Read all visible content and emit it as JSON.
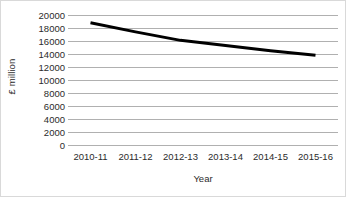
{
  "chart_data": {
    "type": "line",
    "title": "",
    "subtitle": "",
    "xlabel": "Year",
    "ylabel": "£ million",
    "categories": [
      "2010-11",
      "2011-12",
      "2012-13",
      "2013-14",
      "2014-15",
      "2015-16"
    ],
    "series": [
      {
        "name": "£ million",
        "values": [
          18800,
          17400,
          16100,
          15300,
          14500,
          13800
        ],
        "color": "#000000"
      }
    ],
    "ylim": [
      0,
      20000
    ],
    "ytick_step": 2000,
    "yticks": [
      "20000",
      "18000",
      "16000",
      "14000",
      "12000",
      "10000",
      "8000",
      "6000",
      "4000",
      "2000",
      "0"
    ],
    "ytick_values": [
      20000,
      18000,
      16000,
      14000,
      12000,
      10000,
      8000,
      6000,
      4000,
      2000,
      0
    ],
    "grid": true,
    "grid_color": "#b0b0b0",
    "legend": false,
    "legend_position": "none",
    "markers": false,
    "line_width": 3,
    "background_color": "#ffffff",
    "text_color": "#2b2b2b",
    "border_color": "#d9d9d9"
  }
}
